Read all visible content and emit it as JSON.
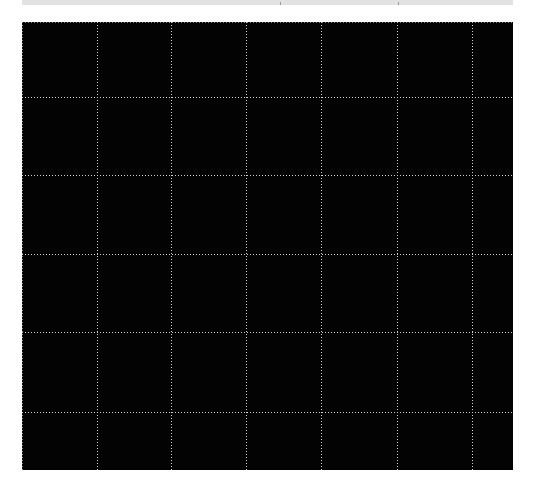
{
  "top_strip": {
    "color": "#e2e2e2",
    "ticks_x": [
      280,
      398
    ]
  },
  "canvas": {
    "background": "#030303",
    "grid_color": "#cfcfcf",
    "grid_style": "dotted",
    "vertical_lines_x": [
      97,
      171,
      246,
      321,
      397,
      472
    ],
    "horizontal_lines_y": [
      97,
      175,
      254,
      332,
      412
    ]
  }
}
